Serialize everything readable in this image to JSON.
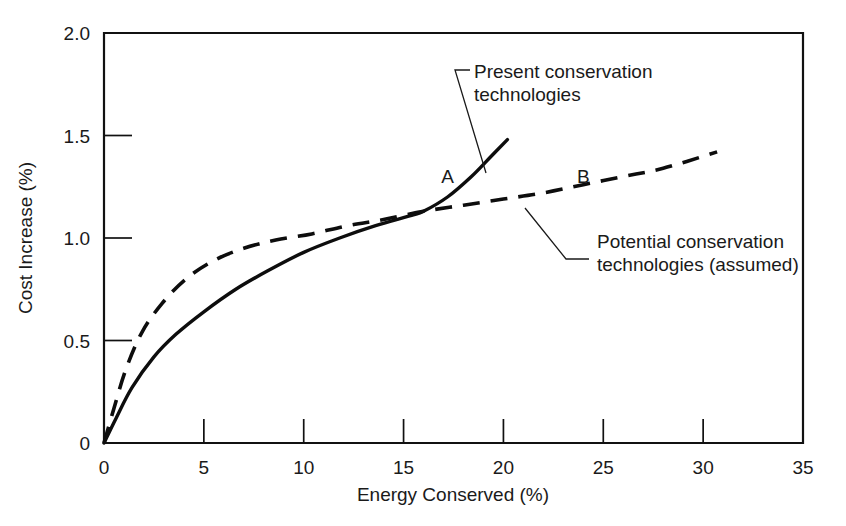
{
  "chart_data": {
    "type": "line",
    "title": "",
    "xlabel": "Energy Conserved (%)",
    "ylabel": "Cost Increase (%)",
    "xlim": [
      0,
      35
    ],
    "ylim": [
      0,
      2.0
    ],
    "grid": false,
    "legend": "none",
    "xticks": [
      "0",
      "5",
      "10",
      "15",
      "20",
      "25",
      "30",
      "35"
    ],
    "xtick_values": [
      0,
      5,
      10,
      15,
      20,
      25,
      30,
      35
    ],
    "yticks": [
      "0",
      "0.5",
      "1.0",
      "1.5",
      "2.0"
    ],
    "ytick_values": [
      0,
      0.5,
      1.0,
      1.5,
      2.0
    ],
    "series": [
      {
        "name": "Present conservation technologies",
        "style": "solid",
        "marker_label": "A",
        "x": [
          0,
          0.6,
          1.4,
          2.5,
          3.6,
          5.0,
          6.6,
          8.2,
          10.0,
          11.8,
          13.6,
          15.4,
          16.0,
          17.2,
          18.4,
          19.4,
          20.2
        ],
        "y": [
          0,
          0.12,
          0.27,
          0.42,
          0.53,
          0.64,
          0.75,
          0.84,
          0.93,
          1.0,
          1.06,
          1.11,
          1.13,
          1.2,
          1.3,
          1.4,
          1.48
        ]
      },
      {
        "name": "Potential conservation technologies (assumed)",
        "style": "dashed",
        "marker_label": "B",
        "x": [
          0,
          0.5,
          1.1,
          1.9,
          2.9,
          4.1,
          5.5,
          7.0,
          8.6,
          10.4,
          12.2,
          14.0,
          16.0,
          18.0,
          20.0,
          22.0,
          24.0,
          26.0,
          28.0,
          30.7
        ],
        "y": [
          0,
          0.17,
          0.36,
          0.54,
          0.68,
          0.8,
          0.89,
          0.95,
          0.99,
          1.02,
          1.06,
          1.09,
          1.13,
          1.16,
          1.19,
          1.22,
          1.26,
          1.3,
          1.34,
          1.42
        ]
      }
    ],
    "annotations": [
      {
        "id": "present",
        "lines": [
          "Present conservation",
          "technologies"
        ],
        "points_to_series": "Present conservation technologies"
      },
      {
        "id": "potential",
        "lines": [
          "Potential conservation",
          "technologies (assumed)"
        ],
        "points_to_series": "Potential conservation technologies (assumed)"
      }
    ],
    "point_labels": [
      {
        "label": "A",
        "x": 17.2,
        "y": 1.27
      },
      {
        "label": "B",
        "x": 24.0,
        "y": 1.27
      }
    ],
    "colors": {
      "axis": "#111111",
      "curve": "#0d0d0d",
      "text": "#1a1a1a",
      "background": "#ffffff"
    }
  }
}
